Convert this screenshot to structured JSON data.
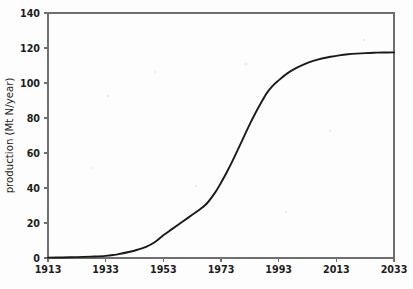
{
  "chart_data": {
    "type": "line",
    "title": "",
    "xlabel": "",
    "ylabel": "production (Mt N/year)",
    "xlim": [
      1913,
      2033
    ],
    "ylim": [
      0,
      140
    ],
    "grid": false,
    "legend": null,
    "x_ticks": [
      1913,
      1933,
      1953,
      1973,
      1993,
      2013,
      2033
    ],
    "y_ticks": [
      0,
      20,
      40,
      60,
      80,
      100,
      120,
      140
    ],
    "x_tick_labels": [
      "1913",
      "1933",
      "1953",
      "1973",
      "1993",
      "2013",
      "2033"
    ],
    "y_tick_labels": [
      "0",
      "20",
      "40",
      "60",
      "80",
      "100",
      "120",
      "140"
    ],
    "series": [
      {
        "name": "production",
        "color": "#1a1a1a",
        "x": [
          1913,
          1918,
          1923,
          1928,
          1933,
          1936,
          1938,
          1941,
          1944,
          1947,
          1950,
          1953,
          1956,
          1959,
          1962,
          1965,
          1968,
          1971,
          1973,
          1975,
          1977,
          1979,
          1981,
          1983,
          1985,
          1987,
          1989,
          1991,
          1993,
          1996,
          1999,
          2002,
          2005,
          2008,
          2011,
          2014,
          2017,
          2020,
          2023,
          2026,
          2029,
          2033
        ],
        "y": [
          0.2,
          0.3,
          0.5,
          0.8,
          1.2,
          1.8,
          2.4,
          3.4,
          4.7,
          6.4,
          9.0,
          13.0,
          16.5,
          20.0,
          23.5,
          27.0,
          31.0,
          37.5,
          43.0,
          49.0,
          55.5,
          62.5,
          69.5,
          76.5,
          83.0,
          89.0,
          94.5,
          98.5,
          101.5,
          105.5,
          108.5,
          110.8,
          112.6,
          114.0,
          115.0,
          115.8,
          116.4,
          116.8,
          117.1,
          117.3,
          117.4,
          117.5
        ]
      }
    ]
  },
  "figure": {
    "plot_left": 48,
    "plot_right": 394,
    "plot_top": 13,
    "plot_bottom": 258
  }
}
